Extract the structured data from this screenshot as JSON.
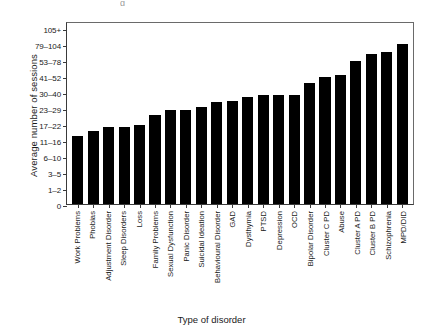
{
  "figure": {
    "artifact_glyph": "g"
  },
  "chart_data": {
    "type": "bar",
    "title": "",
    "xlabel": "Type of disorder",
    "ylabel": "Average number of sessions",
    "grid": false,
    "legend": false,
    "orientation": "vertical",
    "bar_color": "#000000",
    "y_axis_kind": "ordinal-bands",
    "yticks": [
      "0",
      "1–2",
      "3–5",
      "6–10",
      "11–16",
      "17–22",
      "23–29",
      "30–40",
      "41–52",
      "53–78",
      "79–104",
      "105+"
    ],
    "ylim": [
      0,
      11
    ],
    "categories": [
      "Work Problems",
      "Phobias",
      "Adjustment Disorder",
      "Sleep Disorders",
      "Loss",
      "Family Problems",
      "Sexual Dysfunction",
      "Panic Disorder",
      "Suicidal Ideation",
      "Behavioural Disorder",
      "GAD",
      "Dysthymia",
      "PTSD",
      "Depression",
      "OCD",
      "Bipolar Disorder",
      "Cluster C PD",
      "Abuse",
      "Cluster A PD",
      "Cluster B PD",
      "Schizophrenia",
      "MPD/DID"
    ],
    "values": [
      4.25,
      4.55,
      4.8,
      4.8,
      4.95,
      5.55,
      5.9,
      5.9,
      6.1,
      6.4,
      6.45,
      6.7,
      6.8,
      6.8,
      6.85,
      7.6,
      7.95,
      8.1,
      8.95,
      9.4,
      9.5,
      10.0
    ],
    "value_bands": [
      "11–16",
      "11–16",
      "17–22",
      "17–22",
      "17–22",
      "17–22",
      "23–29",
      "23–29",
      "23–29",
      "23–29",
      "23–29",
      "30–40",
      "30–40",
      "30–40",
      "30–40",
      "41–52",
      "41–52",
      "41–52",
      "53–78",
      "53–78",
      "53–78",
      "79–104"
    ]
  }
}
